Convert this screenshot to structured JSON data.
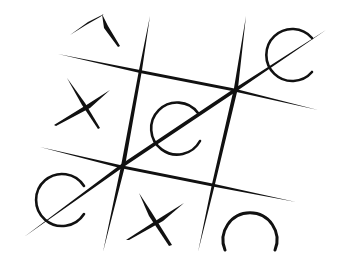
{
  "game": {
    "title": "Tic-tac-toe (hand-drawn)",
    "board": [
      [
        "partial-X",
        "empty",
        "O"
      ],
      [
        "X",
        "O",
        "empty"
      ],
      [
        "O",
        "X",
        "O"
      ]
    ],
    "winning_line": "diagonal from bottom-left O through center O to top-right O",
    "winner": "O",
    "ink_color": "#111111",
    "background_color": "#ffffff"
  }
}
